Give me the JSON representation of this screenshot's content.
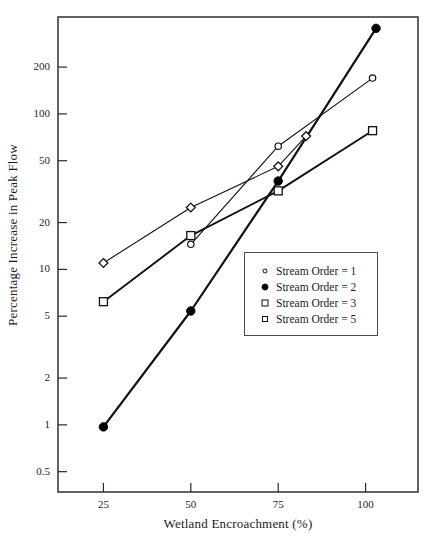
{
  "chart_data": {
    "type": "line",
    "title": "",
    "xlabel": "Wetland Encroachment (%)",
    "ylabel": "Percentage Increase in Peak Flow",
    "xscale": "linear",
    "yscale": "log",
    "xlim": [
      12,
      115
    ],
    "ylim": [
      0.37,
      420
    ],
    "grid": false,
    "legend_position": "center-right",
    "xticks": [
      25,
      50,
      75,
      100
    ],
    "xtick_labels": [
      "25",
      "50",
      "75",
      "100"
    ],
    "yticks": [
      0.5,
      1,
      2,
      5,
      10,
      20,
      50,
      100,
      200
    ],
    "ytick_labels": [
      "0.5",
      "1",
      "2",
      "5",
      "10",
      "20",
      "50",
      "100",
      "200"
    ],
    "series": [
      {
        "name": "Stream Order = 1",
        "marker": "circle-open",
        "x": [
          50,
          75,
          102
        ],
        "values": [
          14.5,
          62,
          170
        ]
      },
      {
        "name": "Stream Order = 2",
        "marker": "circle-filled",
        "x": [
          25,
          50,
          75,
          103
        ],
        "values": [
          0.97,
          5.4,
          37,
          355
        ]
      },
      {
        "name": "Stream Order = 3",
        "marker": "square-open",
        "x": [
          25,
          50,
          75,
          102
        ],
        "values": [
          6.2,
          16.5,
          32,
          78
        ]
      },
      {
        "name": "Stream Order = 5",
        "marker": "diamond-open",
        "x": [
          25,
          50,
          75,
          83
        ],
        "values": [
          11,
          25,
          46,
          72
        ]
      }
    ]
  },
  "legend": {
    "entries": [
      {
        "marker": "circle-open",
        "label": "Stream Order = 1"
      },
      {
        "marker": "circle-filled",
        "label": "Stream Order = 2"
      },
      {
        "marker": "square-open",
        "label": "Stream Order = 3"
      },
      {
        "marker": "diamond-open",
        "label": "Stream Order = 5"
      }
    ]
  },
  "colors": {
    "line": "#111111",
    "frame": "#3c3c3c",
    "text": "#1c1c1c",
    "background": "#ffffff"
  }
}
